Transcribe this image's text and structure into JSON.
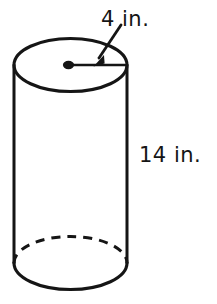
{
  "figure": {
    "name": "right-circular-cylinder-diagram",
    "shape": "cylinder",
    "background_color": "#ffffff",
    "ink_color": "#151515",
    "labels": {
      "radius": "4 in.",
      "height": "14 in."
    },
    "annotations": {
      "radius_marker": "radius-segment-with-center-dot",
      "radius_arrow": "arrow-pointing-to-radius-segment",
      "hidden_edge": "dashed-back-arc-of-bottom-base",
      "center_dot": "center-point-of-top-base"
    },
    "geometry": {
      "top_ellipse_center": [
        70.5,
        65
      ],
      "bottom_ellipse_center": [
        70.5,
        263
      ],
      "ellipse_rx": 56.5,
      "ellipse_ry": 26.5,
      "left_wall_x": 14,
      "right_wall_x": 127,
      "radius_segment_start": [
        69,
        65
      ],
      "radius_segment_end": [
        127,
        65
      ],
      "arrow_tail": [
        121,
        24
      ],
      "arrow_tip": [
        94,
        62
      ]
    }
  }
}
